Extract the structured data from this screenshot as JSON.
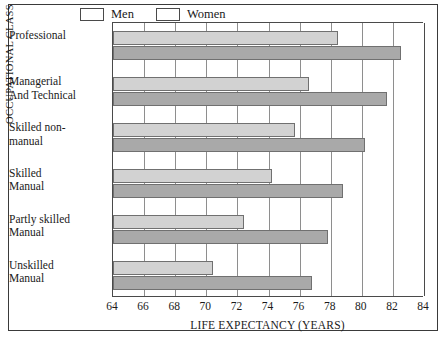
{
  "chart_data": {
    "type": "bar",
    "orientation": "horizontal",
    "title": "",
    "xlabel": "LIFE EXPECTANCY (YEARS)",
    "ylabel": "OCCUPATIONAL CLASS",
    "xlim": [
      64,
      84
    ],
    "xticks": [
      64,
      66,
      68,
      70,
      72,
      74,
      76,
      78,
      80,
      82,
      84
    ],
    "grid": true,
    "legend_position": "top",
    "categories": [
      "Professional",
      "Managerial And Technical",
      "Skilled non-manual",
      "Skilled Manual",
      "Partly skilled Manual",
      "Unskilled Manual"
    ],
    "category_lines": [
      [
        "Professional"
      ],
      [
        "Managerial",
        "And Technical"
      ],
      [
        "Skilled non-",
        "manual"
      ],
      [
        "Skilled",
        "Manual"
      ],
      [
        "Partly skilled",
        "Manual"
      ],
      [
        "Unskilled",
        "Manual"
      ]
    ],
    "series": [
      {
        "name": "Men",
        "color": "#d2d2d2",
        "values": [
          78.5,
          76.6,
          75.7,
          74.2,
          72.4,
          70.4
        ]
      },
      {
        "name": "Women",
        "color": "#a9a9a9",
        "values": [
          82.5,
          81.6,
          80.2,
          78.8,
          77.8,
          76.8
        ]
      }
    ]
  },
  "legend": {
    "entries": [
      {
        "label": "Men",
        "color": "#d2d2d2"
      },
      {
        "label": "Women",
        "color": "#a9a9a9"
      }
    ]
  }
}
